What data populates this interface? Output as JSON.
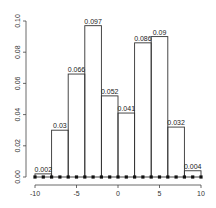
{
  "chart_data": {
    "type": "bar",
    "subtype": "histogram",
    "title": "",
    "xlabel": "",
    "ylabel": "",
    "bin_edges": [
      -10,
      -8,
      -6,
      -4,
      -2,
      0,
      2,
      4,
      6,
      8,
      10
    ],
    "categories": [
      "[-10,-8)",
      "[-8,-6)",
      "[-6,-4)",
      "[-4,-2)",
      "[-2,0)",
      "[0,2)",
      "[2,4)",
      "[4,6)",
      "[6,8)",
      "[8,10]"
    ],
    "values": [
      0.002,
      0.03,
      0.066,
      0.097,
      0.052,
      0.041,
      0.086,
      0.09,
      0.032,
      0.004
    ],
    "data_labels": [
      "0.002",
      "0.03",
      "0.066",
      "0.097",
      "0.052",
      "0.041",
      "0.086",
      "0.09",
      "0.032",
      "0.004"
    ],
    "xlim": [
      -10,
      10
    ],
    "ylim": [
      0,
      0.1
    ],
    "x_ticks": [
      "-10",
      "-5",
      "0",
      "5",
      "10"
    ],
    "y_ticks": [
      "0.00",
      "0.02",
      "0.04",
      "0.06",
      "0.08",
      "0.10"
    ],
    "baseline_points": {
      "x": [
        -10,
        -9,
        -8,
        -7,
        -6,
        -5,
        -4,
        -3,
        -2,
        -1,
        0,
        1,
        2,
        3,
        4,
        5,
        6,
        7,
        8,
        9,
        10
      ],
      "y": 0
    },
    "grid": false,
    "legend": null
  },
  "colors": {
    "bar_stroke": "#333333",
    "bar_fill": "none",
    "point": "#111111",
    "text": "#222222"
  }
}
